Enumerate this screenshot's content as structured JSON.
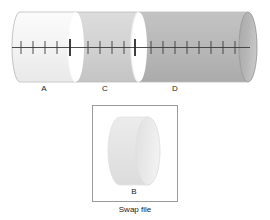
{
  "figure": {
    "type": "memory-segment-cylinder-diagram",
    "background_color": "#ffffff",
    "main_cylinder": {
      "name": "main-memory-cylinder",
      "orientation": "horizontal",
      "left_cap_style": "concave-arc",
      "right_cap_style": "ellipse",
      "segments": [
        {
          "id": "A",
          "label": "A",
          "fill": "#f2f2f2",
          "edge_highlight": "#ffffff"
        },
        {
          "id": "C",
          "label": "C",
          "fill": "#d2d2d2",
          "edge_highlight": "#f6f6f6"
        },
        {
          "id": "D",
          "label": "D",
          "fill": "#b9b9b9",
          "edge_highlight": "#ededed"
        }
      ],
      "axis": {
        "name": "tick-axis",
        "color": "#333333",
        "minor_tick_count": 19,
        "major_tick_positions": [
          "A-C-boundary",
          "C-D-boundary"
        ]
      }
    },
    "swap_box": {
      "name": "swap-file-box",
      "border_color": "#999999",
      "fill": "#ffffff",
      "caption": "Swap file",
      "inner_cylinder": {
        "label": "B",
        "fill": "#e6e6e6",
        "cap_fill": "#efefef",
        "outline": "#d8d8d8"
      }
    },
    "colors": {
      "text": "#1a1a1a",
      "line": "#333333",
      "border": "#999999"
    }
  }
}
